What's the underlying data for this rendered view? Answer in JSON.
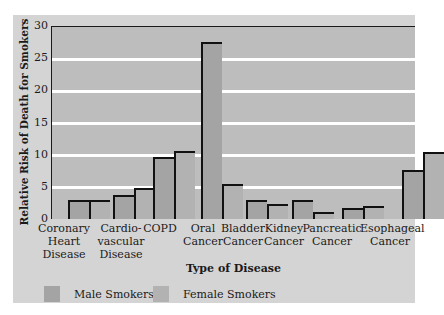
{
  "chart_data": {
    "type": "bar",
    "title": "",
    "xlabel": "Type of Disease",
    "ylabel": "Relative Risk of Death for Smokers",
    "ylim": [
      0,
      30
    ],
    "yticks": [
      0,
      5,
      10,
      15,
      20,
      25,
      30
    ],
    "grid": true,
    "legend_position": "bottom",
    "categories": [
      "Coronary Heart Disease",
      "Cardio-vascular Disease",
      "COPD",
      "Oral Cancer",
      "Bladder Cancer",
      "Kidney Cancer",
      "Pancreatic Cancer",
      "Esophageal Cancer"
    ],
    "series": [
      {
        "name": "Male Smokers",
        "color": "#a4a4a4",
        "values": [
          2.9,
          3.8,
          9.7,
          27.5,
          2.9,
          3.0,
          1.7,
          7.6
        ]
      },
      {
        "name": "Female Smokers",
        "color": "#b2b2b2",
        "values": [
          3.0,
          4.8,
          10.5,
          5.5,
          2.3,
          1.1,
          2.0,
          10.4
        ]
      }
    ]
  },
  "axis": {
    "ylabel": "Relative Risk of Death for Smokers",
    "xlabel": "Type of Disease",
    "yticks": [
      "0",
      "5",
      "10",
      "15",
      "20",
      "25",
      "30"
    ]
  },
  "categories": [
    {
      "lines": [
        "Coronary",
        "Heart",
        "Disease"
      ]
    },
    {
      "lines": [
        "Cardio-",
        "vascular",
        "Disease"
      ]
    },
    {
      "lines": [
        "COPD"
      ]
    },
    {
      "lines": [
        "Oral",
        "Cancer"
      ]
    },
    {
      "lines": [
        "Bladder",
        "Cancer"
      ]
    },
    {
      "lines": [
        "Kidney",
        "Cancer"
      ]
    },
    {
      "lines": [
        "Pancreatic",
        "Cancer"
      ]
    },
    {
      "lines": [
        "Esophageal",
        "Cancer"
      ]
    }
  ],
  "legend": [
    {
      "label": "Male Smokers",
      "color": "#a4a4a4"
    },
    {
      "label": "Female Smokers",
      "color": "#b2b2b2"
    }
  ]
}
